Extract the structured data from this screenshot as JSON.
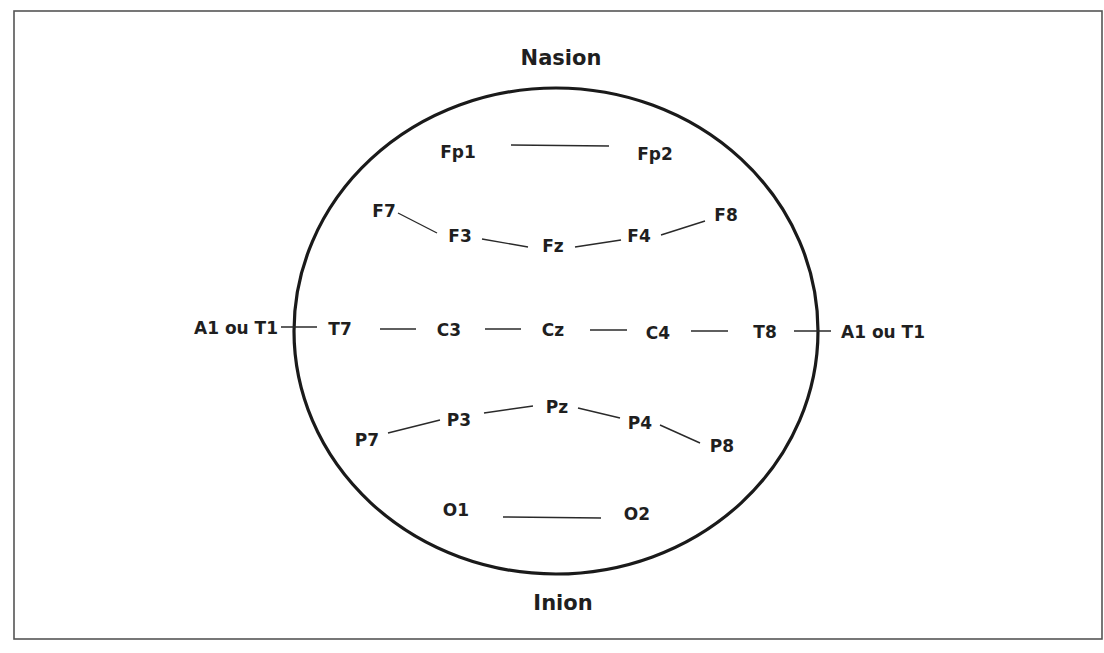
{
  "diagram": {
    "colors": {
      "frame": "#555555",
      "head_outline": "#1a1a1a",
      "text": "#1f1f1f",
      "background": "#ffffff"
    },
    "landmarks": {
      "top": {
        "label": "Nasion",
        "x": 561,
        "y": 58
      },
      "bottom": {
        "label": "Inion",
        "x": 563,
        "y": 603
      }
    },
    "ear_references": {
      "left": {
        "label": "A1 ou T1",
        "x": 236,
        "y": 328
      },
      "right": {
        "label": "A1 ou T1",
        "x": 883,
        "y": 332
      }
    },
    "electrodes": {
      "Fp1": {
        "label": "Fp1",
        "x": 458,
        "y": 152
      },
      "Fp2": {
        "label": "Fp2",
        "x": 655,
        "y": 154
      },
      "F7": {
        "label": "F7",
        "x": 384,
        "y": 211
      },
      "F3": {
        "label": "F3",
        "x": 460,
        "y": 236
      },
      "Fz": {
        "label": "Fz",
        "x": 553,
        "y": 246
      },
      "F4": {
        "label": "F4",
        "x": 639,
        "y": 236
      },
      "F8": {
        "label": "F8",
        "x": 726,
        "y": 215
      },
      "T7": {
        "label": "T7",
        "x": 340,
        "y": 329
      },
      "C3": {
        "label": "C3",
        "x": 449,
        "y": 330
      },
      "Cz": {
        "label": "Cz",
        "x": 553,
        "y": 330
      },
      "C4": {
        "label": "C4",
        "x": 658,
        "y": 333
      },
      "T8": {
        "label": "T8",
        "x": 765,
        "y": 332
      },
      "P7": {
        "label": "P7",
        "x": 367,
        "y": 440
      },
      "P3": {
        "label": "P3",
        "x": 459,
        "y": 420
      },
      "Pz": {
        "label": "Pz",
        "x": 557,
        "y": 407
      },
      "P4": {
        "label": "P4",
        "x": 640,
        "y": 423
      },
      "P8": {
        "label": "P8",
        "x": 722,
        "y": 446
      },
      "O1": {
        "label": "O1",
        "x": 456,
        "y": 510
      },
      "O2": {
        "label": "O2",
        "x": 637,
        "y": 514
      }
    },
    "connections": [
      {
        "from": "Fp1",
        "to": "Fp2"
      },
      {
        "from": "F7",
        "to": "F3"
      },
      {
        "from": "F3",
        "to": "Fz"
      },
      {
        "from": "Fz",
        "to": "F4"
      },
      {
        "from": "F4",
        "to": "F8"
      },
      {
        "from": "A1 ou T1 (left)",
        "to": "T7"
      },
      {
        "from": "T7",
        "to": "C3"
      },
      {
        "from": "C3",
        "to": "Cz"
      },
      {
        "from": "Cz",
        "to": "C4"
      },
      {
        "from": "C4",
        "to": "T8"
      },
      {
        "from": "T8",
        "to": "A1 ou T1 (right)"
      },
      {
        "from": "P7",
        "to": "P3"
      },
      {
        "from": "P3",
        "to": "Pz"
      },
      {
        "from": "Pz",
        "to": "P4"
      },
      {
        "from": "P4",
        "to": "P8"
      },
      {
        "from": "O1",
        "to": "O2"
      }
    ]
  }
}
